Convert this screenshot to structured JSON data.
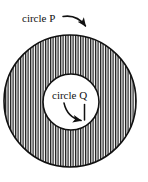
{
  "figure": {
    "background_color": "#ffffff",
    "stroke_color": "#111111",
    "hatch_color": "#1a1a1a",
    "inner_fill_color": "#ffffff"
  },
  "labels": {
    "outer_label": "circle P",
    "inner_label": "circle Q"
  },
  "shapes": {
    "outer_circle": {
      "name": "circle P",
      "center_x": 70,
      "center_y": 101,
      "radius": 66,
      "fill": "vertical-hatch",
      "stroke_width": 1.5
    },
    "inner_circle": {
      "name": "circle Q",
      "center_x": 71,
      "center_y": 102,
      "radius": 28,
      "fill": "white",
      "stroke_width": 1.5
    }
  },
  "annotations": {
    "outer_arrow": {
      "name": "arrow-to-circle-p",
      "from_x": 64,
      "from_y": 17,
      "to_x": 88,
      "to_y": 30,
      "style": "curved-arrow"
    },
    "inner_arrow": {
      "name": "arrow-to-circle-q",
      "from_x": 64,
      "from_y": 103,
      "to_x": 84,
      "to_y": 120,
      "style": "curved-arrow"
    }
  },
  "hatch": {
    "period_px": 2.5,
    "line_width_px": 1.25,
    "orientation": "vertical"
  }
}
